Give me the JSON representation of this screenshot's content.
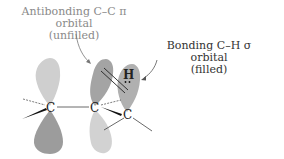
{
  "labels": {
    "antibonding": {
      "line1": "Antibonding C–C π orbital",
      "line2": "(unfilled)"
    },
    "bonding": {
      "line1": "Bonding C–H σ orbital",
      "line2": "(filled)"
    }
  },
  "atoms": {
    "c1": "C",
    "c2": "C",
    "c3": "C",
    "h": "H"
  },
  "colors": {
    "lobe_light": "#c9c9c9",
    "lobe_dark": "#9a9a9a",
    "lobe_mid": "#a8a8a8",
    "bond": "#222222",
    "arrow": "#555555",
    "label_gray": "#8a8a8a",
    "label_dark": "#333333"
  }
}
